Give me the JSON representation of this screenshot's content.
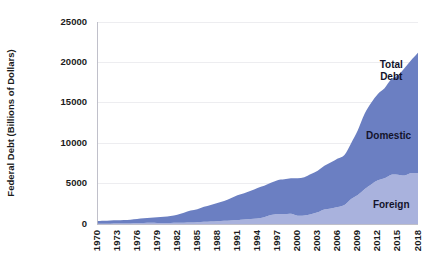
{
  "chart_data": {
    "type": "area",
    "stacked": true,
    "title": "",
    "subtitle": "",
    "xlabel": "",
    "ylabel": "Federal Debt (Billions of Dollars)",
    "xlim": [
      1970,
      2018
    ],
    "ylim": [
      0,
      25000
    ],
    "ytick_labels": [
      "0",
      "5000",
      "10000",
      "15000",
      "20000",
      "25000"
    ],
    "yticks": [
      0,
      5000,
      10000,
      15000,
      20000,
      25000
    ],
    "xticks": [
      1970,
      1973,
      1976,
      1979,
      1982,
      1985,
      1988,
      1991,
      1994,
      1997,
      2000,
      2003,
      2006,
      2009,
      2012,
      2015,
      2018
    ],
    "xtick_labels": [
      "1970",
      "1973",
      "1976",
      "1979",
      "1982",
      "1985",
      "1988",
      "1991",
      "1994",
      "1997",
      "2000",
      "2003",
      "2006",
      "2009",
      "2012",
      "2015",
      "2018"
    ],
    "grid": true,
    "legend_position": "inline-annotations",
    "x": [
      1970,
      1971,
      1972,
      1973,
      1974,
      1975,
      1976,
      1977,
      1978,
      1979,
      1980,
      1981,
      1982,
      1983,
      1984,
      1985,
      1986,
      1987,
      1988,
      1989,
      1990,
      1991,
      1992,
      1993,
      1994,
      1995,
      1996,
      1997,
      1998,
      1999,
      2000,
      2001,
      2002,
      2003,
      2004,
      2005,
      2006,
      2007,
      2008,
      2009,
      2010,
      2011,
      2012,
      2013,
      2014,
      2015,
      2016,
      2017,
      2018
    ],
    "series": [
      {
        "name": "Foreign",
        "color": "#a9b2dd",
        "values": [
          20,
          25,
          35,
          50,
          60,
          70,
          80,
          110,
          140,
          125,
          130,
          135,
          150,
          165,
          180,
          225,
          265,
          300,
          345,
          395,
          440,
          460,
          545,
          620,
          670,
          835,
          1100,
          1230,
          1225,
          1270,
          1030,
          1040,
          1200,
          1450,
          1800,
          1930,
          2100,
          2350,
          3100,
          3600,
          4300,
          4900,
          5400,
          5650,
          6100,
          6100,
          6000,
          6300,
          6300
        ]
      },
      {
        "name": "Domestic",
        "color": "#6b7fc2",
        "values": [
          350,
          375,
          400,
          400,
          420,
          470,
          550,
          590,
          630,
          705,
          780,
          860,
          1000,
          1215,
          1480,
          1600,
          1860,
          2050,
          2260,
          2450,
          2750,
          3100,
          3250,
          3500,
          3800,
          3900,
          3990,
          4200,
          4300,
          4400,
          4640,
          4750,
          4980,
          5150,
          5400,
          5700,
          6000,
          6200,
          6900,
          8000,
          9300,
          10100,
          10700,
          11150,
          11800,
          12300,
          13300,
          14000,
          14900
        ]
      }
    ],
    "total_label": "Total Debt",
    "annotations": [
      {
        "text": "Total Debt",
        "series": "total",
        "x": 2014.0,
        "y": 19700
      },
      {
        "text": "Domestic",
        "series": "domestic",
        "x": 2013.6,
        "y": 10800
      },
      {
        "text": "Foreign",
        "series": "foreign",
        "x": 2014.0,
        "y": 2300
      }
    ]
  },
  "axis": {
    "y_title": "Federal Debt (Billions of Dollars)"
  },
  "labels": {
    "total_debt_line1": "Total",
    "total_debt_line2": "Debt",
    "domestic": "Domestic",
    "foreign": "Foreign"
  }
}
